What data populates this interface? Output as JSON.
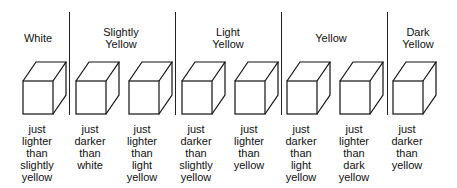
{
  "categories": [
    {
      "label_line1": "White",
      "label_line2": "",
      "center_x": 38
    },
    {
      "label_line1": "Slightly",
      "label_line2": "Yellow",
      "center_x": 121
    },
    {
      "label_line1": "Light",
      "label_line2": "Yellow",
      "center_x": 228
    },
    {
      "label_line1": "Yellow",
      "label_line2": "",
      "center_x": 331
    },
    {
      "label_line1": "Dark",
      "label_line2": "Yellow",
      "center_x": 418
    }
  ],
  "dividers_x": [
    69,
    175,
    281,
    387
  ],
  "cubes": [
    {
      "x": 22,
      "lines": [
        "just",
        "lighter",
        "than",
        "slightly",
        "yellow"
      ]
    },
    {
      "x": 75,
      "lines": [
        "just",
        "darker",
        "than",
        "white",
        ""
      ]
    },
    {
      "x": 128,
      "lines": [
        "just",
        "lighter",
        "than",
        "light",
        "yellow"
      ]
    },
    {
      "x": 181,
      "lines": [
        "just",
        "darker",
        "than",
        "slightly",
        "yellow"
      ]
    },
    {
      "x": 234,
      "lines": [
        "just",
        "lighter",
        "than",
        "yellow",
        ""
      ]
    },
    {
      "x": 286,
      "lines": [
        "just",
        "darker",
        "than",
        "light",
        "yellow"
      ]
    },
    {
      "x": 339,
      "lines": [
        "just",
        "lighter",
        "than",
        "dark",
        "yellow"
      ]
    },
    {
      "x": 392,
      "lines": [
        "just",
        "darker",
        "than",
        "yellow",
        ""
      ]
    }
  ]
}
